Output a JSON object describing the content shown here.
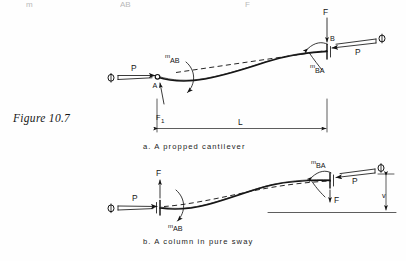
{
  "figure": {
    "number_label": "Figure 10.7",
    "page_top_fragments": [
      "m",
      "AB",
      "F"
    ]
  },
  "diagrams": [
    {
      "id": "a",
      "caption": "a.     A   propped  cantilever",
      "caption_prefix": "a.",
      "caption_text": "A   propped  cantilever",
      "description": "A propped cantilever with pinned end A and fixed end B, axial load P, transverse load F, end moments and rotation phi",
      "nodes": [
        {
          "name": "A",
          "label": "A",
          "type": "pin-support"
        },
        {
          "name": "B",
          "label": "B",
          "type": "fixed-end"
        }
      ],
      "labels": [
        {
          "name": "rotation-phi-left",
          "text": "Φ"
        },
        {
          "name": "axial-load-left",
          "text": "P"
        },
        {
          "name": "moment-ab",
          "text": "m",
          "sub": "AB"
        },
        {
          "name": "reaction-f1",
          "text": "F",
          "sub": "1"
        },
        {
          "name": "span-length",
          "text": "L"
        },
        {
          "name": "transverse-load-f",
          "text": "F"
        },
        {
          "name": "moment-ba",
          "text": "m",
          "sub": "BA"
        },
        {
          "name": "axial-load-right",
          "text": "P"
        },
        {
          "name": "rotation-phi-right",
          "text": "Φ"
        }
      ]
    },
    {
      "id": "b",
      "caption": "b.   A    column  in  pure  sway",
      "caption_prefix": "b.",
      "caption_text": "A    column  in  pure  sway",
      "description": "A column in pure sway with equal end rotations phi, axial load P, shear F and end moments m_AB and m_BA, sway deflection at right",
      "nodes": [],
      "labels": [
        {
          "name": "rotation-phi-left",
          "text": "Φ"
        },
        {
          "name": "axial-load-left",
          "text": "P"
        },
        {
          "name": "shear-f-left",
          "text": "F"
        },
        {
          "name": "moment-ab",
          "text": "m",
          "sub": "AB"
        },
        {
          "name": "moment-ba",
          "text": "m",
          "sub": "BA"
        },
        {
          "name": "axial-load-right",
          "text": "P"
        },
        {
          "name": "rotation-phi-right",
          "text": "Φ"
        },
        {
          "name": "shear-f-right",
          "text": "F"
        },
        {
          "name": "sway-deflection",
          "text": "v"
        }
      ]
    }
  ],
  "colors": {
    "background": "#fefefe",
    "ink": "#141414",
    "faded_ink": "#b9b9b9"
  }
}
